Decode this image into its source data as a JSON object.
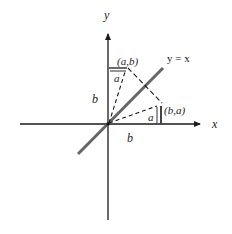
{
  "diagram": {
    "axes": {
      "x_label": "x",
      "y_label": "y"
    },
    "line_label": "y = x",
    "points": [
      {
        "name": "point-ab",
        "label": "(a,b)"
      },
      {
        "name": "point-ba",
        "label": "(b,a)"
      }
    ],
    "segment_labels": {
      "ab_horizontal": "a",
      "ab_vertical": "b",
      "ba_vertical": "a",
      "ba_horizontal": "b"
    },
    "colors": {
      "axis": "#1a1a1a",
      "diagonal": "#666666",
      "dashed": "#1a1a1a",
      "text": "#222222"
    }
  }
}
